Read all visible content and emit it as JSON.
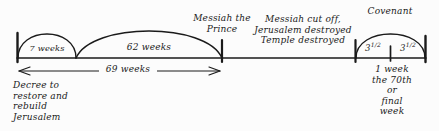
{
  "diagram": {
    "background_color": "#fcfcfc",
    "ink_color": "#1a1a1a",
    "arcs": {
      "seven_weeks_label": "7 weeks",
      "sixty_two_weeks_label": "62 weeks",
      "covenant_label": "Covenant"
    },
    "measures": {
      "sixty_nine_weeks_label": "69 weeks"
    },
    "segments": {
      "first_half_label": "3",
      "first_half_fraction": "1/2",
      "second_half_label": "3",
      "second_half_fraction": "1/2"
    },
    "events": {
      "decree": "Decree to\nrestore and\nrebuild\nJerusalem",
      "messiah_prince": "Messiah the\nPrince",
      "messiah_cut_off": "Messiah cut off,\nJerusalem destroyed\nTemple destroyed",
      "final_week": "1 week\nthe 70th or\nfinal week"
    }
  }
}
